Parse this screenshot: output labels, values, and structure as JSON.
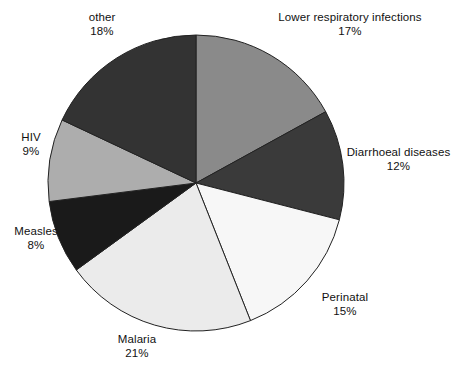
{
  "chart_data": {
    "type": "pie",
    "title": "",
    "subtitle": "",
    "xlabel": "",
    "ylabel": "",
    "legend_position": "outside-labels",
    "grid": false,
    "units": "%",
    "start_angle_deg": 0,
    "direction": "clockwise",
    "categories": [
      "Lower respiratory infections",
      "Diarrhoeal diseases",
      "Perinatal",
      "Malaria",
      "Measles",
      "HIV",
      "other"
    ],
    "values": [
      17,
      12,
      15,
      21,
      8,
      9,
      18
    ],
    "colors": [
      "#8a8a8a",
      "#3a3a3a",
      "#f7f7f7",
      "#ebebeb",
      "#1a1a1a",
      "#adadad",
      "#333333"
    ],
    "slices": [
      {
        "label": "Lower respiratory infections",
        "value": 17,
        "value_text": "17%",
        "color": "#8a8a8a"
      },
      {
        "label": "Diarrhoeal diseases",
        "value": 12,
        "value_text": "12%",
        "color": "#3a3a3a"
      },
      {
        "label": "Perinatal",
        "value": 15,
        "value_text": "15%",
        "color": "#f7f7f7"
      },
      {
        "label": "Malaria",
        "value": 21,
        "value_text": "21%",
        "color": "#ebebeb"
      },
      {
        "label": "Measles",
        "value": 8,
        "value_text": "8%",
        "color": "#1a1a1a"
      },
      {
        "label": "HIV",
        "value": 9,
        "value_text": "9%",
        "color": "#adadad"
      },
      {
        "label": "other",
        "value": 18,
        "value_text": "18%",
        "color": "#333333"
      }
    ]
  },
  "labels": {
    "lower_respiratory": {
      "name": "Lower respiratory infections",
      "value": "17%"
    },
    "diarrhoeal": {
      "name": "Diarrhoeal diseases",
      "value": "12%"
    },
    "perinatal": {
      "name": "Perinatal",
      "value": "15%"
    },
    "malaria": {
      "name": "Malaria",
      "value": "21%"
    },
    "measles": {
      "name": "Measles",
      "value": "8%"
    },
    "hiv": {
      "name": "HIV",
      "value": "9%"
    },
    "other": {
      "name": "other",
      "value": "18%"
    }
  },
  "style": {
    "outline_color": "#222222",
    "background": "#ffffff"
  }
}
